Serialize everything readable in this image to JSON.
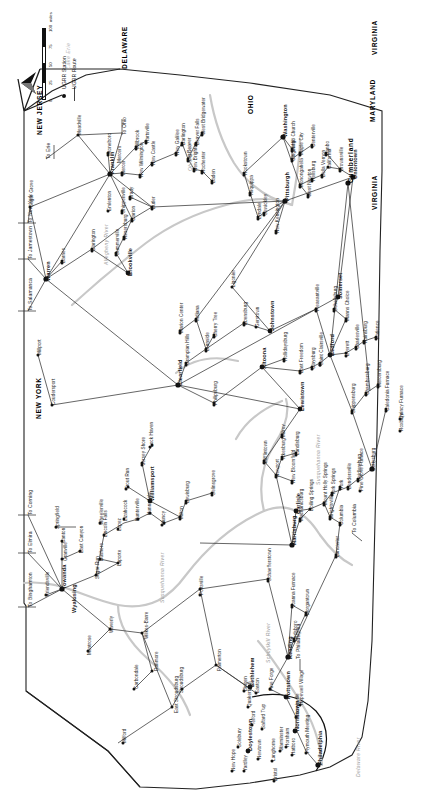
{
  "map": {
    "title": "Underground Railroad in Pennsylvania",
    "orientation": "rotated-90-ccw",
    "legend": {
      "station_label": "UGRR Station",
      "route_label": "UGRR Route",
      "scale_ticks": [
        "0",
        "25",
        "50",
        "75",
        "100"
      ],
      "scale_units": "miles",
      "north_label": "N"
    },
    "states": [
      {
        "name": "NEW JERSEY",
        "x": 676,
        "y": 37
      },
      {
        "name": "DELAWARE",
        "x": 742,
        "y": 122
      },
      {
        "name": "NEW YORK",
        "x": 392,
        "y": 36
      },
      {
        "name": "MARYLAND",
        "x": 689,
        "y": 370
      },
      {
        "name": "VIRGINIA",
        "x": 601,
        "y": 372
      },
      {
        "name": "VIRGINIA",
        "x": 756,
        "y": 372
      },
      {
        "name": "OHIO",
        "x": 697,
        "y": 248
      },
      {
        "name": "Cumberland",
        "x": 628,
        "y": 348
      }
    ],
    "waters": [
      {
        "name": "Lake Erie",
        "x": 742,
        "y": 66
      },
      {
        "name": "Delaware River",
        "x": 34,
        "y": 356
      },
      {
        "name": "Schuylkill River",
        "x": 148,
        "y": 266
      },
      {
        "name": "Susquehanna River",
        "x": 326,
        "y": 316
      },
      {
        "name": "Susquehanna River",
        "x": 208,
        "y": 160
      },
      {
        "name": "Allegheny River",
        "x": 546,
        "y": 104
      },
      {
        "name": "Ohio River",
        "x": 640,
        "y": 188
      }
    ],
    "major_cities": [
      {
        "name": "Philadelphia",
        "x": 46,
        "y": 318
      },
      {
        "name": "Norristown",
        "x": 80,
        "y": 295
      },
      {
        "name": "Doylestown",
        "x": 60,
        "y": 248
      },
      {
        "name": "Bethlehem",
        "x": 124,
        "y": 250
      },
      {
        "name": "Reading",
        "x": 152,
        "y": 288
      },
      {
        "name": "Pottstown",
        "x": 112,
        "y": 286
      },
      {
        "name": "Harrisburg",
        "x": 266,
        "y": 292
      },
      {
        "name": "Carlisle",
        "x": 297,
        "y": 296
      },
      {
        "name": "Williamsport",
        "x": 310,
        "y": 150
      },
      {
        "name": "Clearfield",
        "x": 425,
        "y": 178
      },
      {
        "name": "Altoona",
        "x": 442,
        "y": 262
      },
      {
        "name": "Lewistown",
        "x": 400,
        "y": 300
      },
      {
        "name": "Bedford",
        "x": 455,
        "y": 330
      },
      {
        "name": "Johnstown",
        "x": 480,
        "y": 270
      },
      {
        "name": "Somerset",
        "x": 512,
        "y": 338
      },
      {
        "name": "Pittsburgh",
        "x": 610,
        "y": 285
      },
      {
        "name": "Uniontown",
        "x": 632,
        "y": 353
      },
      {
        "name": "Washington",
        "x": 674,
        "y": 283
      },
      {
        "name": "Franklin",
        "x": 637,
        "y": 110
      },
      {
        "name": "Warren",
        "x": 530,
        "y": 46
      },
      {
        "name": "Brookville",
        "x": 535,
        "y": 128
      },
      {
        "name": "Towanda",
        "x": 222,
        "y": 62
      },
      {
        "name": "Wyalusing",
        "x": 198,
        "y": 72
      }
    ],
    "places": [
      {
        "name": "Milford",
        "x": 68,
        "y": 123
      },
      {
        "name": "East Stroudsburg",
        "x": 98,
        "y": 175
      },
      {
        "name": "Stroudsburg",
        "x": 118,
        "y": 180
      },
      {
        "name": "Palmerton",
        "x": 140,
        "y": 218
      },
      {
        "name": "Easton",
        "x": 118,
        "y": 256
      },
      {
        "name": "Carbondale",
        "x": 122,
        "y": 135
      },
      {
        "name": "Dunmore",
        "x": 140,
        "y": 155
      },
      {
        "name": "Wilkes-Barre",
        "x": 172,
        "y": 145
      },
      {
        "name": "Waverly",
        "x": 178,
        "y": 110
      },
      {
        "name": "Montrose",
        "x": 156,
        "y": 88
      },
      {
        "name": "Friendsville",
        "x": 215,
        "y": 46
      },
      {
        "name": "Sugar Run",
        "x": 232,
        "y": 96
      },
      {
        "name": "Laporte",
        "x": 245,
        "y": 118
      },
      {
        "name": "Dushore",
        "x": 250,
        "y": 100
      },
      {
        "name": "Granville",
        "x": 250,
        "y": 64
      },
      {
        "name": "East Canyon",
        "x": 258,
        "y": 80
      },
      {
        "name": "Springfield",
        "x": 282,
        "y": 56
      },
      {
        "name": "Canton",
        "x": 268,
        "y": 62
      },
      {
        "name": "Wheelerville",
        "x": 286,
        "y": 100
      },
      {
        "name": "Lincoln Falls",
        "x": 274,
        "y": 104
      },
      {
        "name": "Lopez",
        "x": 280,
        "y": 118
      },
      {
        "name": "Lizahcock",
        "x": 290,
        "y": 124
      },
      {
        "name": "Hunterville",
        "x": 290,
        "y": 136
      },
      {
        "name": "Hunnydale",
        "x": 296,
        "y": 148
      },
      {
        "name": "Muncy",
        "x": 286,
        "y": 162
      },
      {
        "name": "Milton",
        "x": 292,
        "y": 180
      },
      {
        "name": "Lewisburg",
        "x": 308,
        "y": 186
      },
      {
        "name": "Selinsgrove",
        "x": 316,
        "y": 212
      },
      {
        "name": "Trout Run",
        "x": 322,
        "y": 126
      },
      {
        "name": "Jersey Shore",
        "x": 346,
        "y": 142
      },
      {
        "name": "Lock Haven",
        "x": 364,
        "y": 150
      },
      {
        "name": "Mifflintown",
        "x": 348,
        "y": 264
      },
      {
        "name": "Newport",
        "x": 334,
        "y": 276
      },
      {
        "name": "New Bloomfield",
        "x": 328,
        "y": 292
      },
      {
        "name": "Ickesburg",
        "x": 352,
        "y": 282
      },
      {
        "name": "Landisburg",
        "x": 356,
        "y": 296
      },
      {
        "name": "Milroy",
        "x": 374,
        "y": 282
      },
      {
        "name": "Philipsburg",
        "x": 406,
        "y": 214
      },
      {
        "name": "Hollidaysburg",
        "x": 450,
        "y": 284
      },
      {
        "name": "Burnside",
        "x": 460,
        "y": 206
      },
      {
        "name": "Cherry Tree",
        "x": 474,
        "y": 214
      },
      {
        "name": "Grampian Hills",
        "x": 446,
        "y": 186
      },
      {
        "name": "Indiana",
        "x": 490,
        "y": 196
      },
      {
        "name": "Marion Center",
        "x": 478,
        "y": 180
      },
      {
        "name": "Ebensburg",
        "x": 486,
        "y": 244
      },
      {
        "name": "Gerstown",
        "x": 484,
        "y": 256
      },
      {
        "name": "Ligonier",
        "x": 524,
        "y": 232
      },
      {
        "name": "East Freedom",
        "x": 438,
        "y": 300
      },
      {
        "name": "Claysburg",
        "x": 442,
        "y": 312
      },
      {
        "name": "Saint Clairsville",
        "x": 446,
        "y": 320
      },
      {
        "name": "Everett",
        "x": 455,
        "y": 346
      },
      {
        "name": "Charlesville",
        "x": 462,
        "y": 356
      },
      {
        "name": "Rainsburg",
        "x": 468,
        "y": 364
      },
      {
        "name": "Patience",
        "x": 472,
        "y": 376
      },
      {
        "name": "Schellsburg",
        "x": 500,
        "y": 334
      },
      {
        "name": "Manns Choice",
        "x": 490,
        "y": 346
      },
      {
        "name": "Pleasantville",
        "x": 500,
        "y": 316
      },
      {
        "name": "Mercersburg",
        "x": 424,
        "y": 378
      },
      {
        "name": "Chambersburg",
        "x": 416,
        "y": 366
      },
      {
        "name": "Shippensburg",
        "x": 398,
        "y": 352
      },
      {
        "name": "Caledonia Furnace",
        "x": 400,
        "y": 386
      },
      {
        "name": "Quincy Furnace",
        "x": 392,
        "y": 400
      },
      {
        "name": "Roxbury",
        "x": 380,
        "y": 400
      },
      {
        "name": "Gettysburg",
        "x": 340,
        "y": 372
      },
      {
        "name": "Heidlersburg",
        "x": 330,
        "y": 358
      },
      {
        "name": "Bendersville",
        "x": 322,
        "y": 348
      },
      {
        "name": "York Springs",
        "x": 316,
        "y": 332
      },
      {
        "name": "Mount Holly Springs",
        "x": 306,
        "y": 324
      },
      {
        "name": "Boiling Springs",
        "x": 300,
        "y": 310
      },
      {
        "name": "Pine Grove Furnace",
        "x": 320,
        "y": 360
      },
      {
        "name": "Mechanicsburg",
        "x": 290,
        "y": 300
      },
      {
        "name": "York",
        "x": 322,
        "y": 340
      },
      {
        "name": "Wrightsville",
        "x": 292,
        "y": 330
      },
      {
        "name": "Columbia",
        "x": 286,
        "y": 340
      },
      {
        "name": "Lancaster",
        "x": 254,
        "y": 336
      },
      {
        "name": "Morgantown",
        "x": 196,
        "y": 306
      },
      {
        "name": "Joanna Furnace",
        "x": 204,
        "y": 292
      },
      {
        "name": "Birdsboro",
        "x": 170,
        "y": 294
      },
      {
        "name": "Schaefferstown",
        "x": 230,
        "y": 268
      },
      {
        "name": "Pottsville",
        "x": 216,
        "y": 200
      },
      {
        "name": "Quakertown",
        "x": 104,
        "y": 248
      },
      {
        "name": "Pine Forge",
        "x": 120,
        "y": 270
      },
      {
        "name": "Phoenixville",
        "x": 92,
        "y": 296
      },
      {
        "name": "Hopewell Village",
        "x": 106,
        "y": 300
      },
      {
        "name": "Bingen",
        "x": 120,
        "y": 244
      },
      {
        "name": "New Hope",
        "x": 40,
        "y": 232
      },
      {
        "name": "Newtown",
        "x": 52,
        "y": 258
      },
      {
        "name": "Langhorne",
        "x": 50,
        "y": 272
      },
      {
        "name": "Yardley",
        "x": 40,
        "y": 244
      },
      {
        "name": "Bristol",
        "x": 30,
        "y": 274
      },
      {
        "name": "Warminster",
        "x": 60,
        "y": 280
      },
      {
        "name": "Hatboro",
        "x": 56,
        "y": 292
      },
      {
        "name": "Horsham",
        "x": 64,
        "y": 286
      },
      {
        "name": "Salfard Twp",
        "x": 82,
        "y": 262
      },
      {
        "name": "Solebury",
        "x": 64,
        "y": 238
      },
      {
        "name": "Telford",
        "x": 86,
        "y": 252
      },
      {
        "name": "Plymouth Meeting",
        "x": 58,
        "y": 306
      },
      {
        "name": "New Kensington",
        "x": 578,
        "y": 276
      },
      {
        "name": "Lyndale",
        "x": 592,
        "y": 258
      },
      {
        "name": "Sewickley",
        "x": 596,
        "y": 264
      },
      {
        "name": "Aliquippa",
        "x": 616,
        "y": 250
      },
      {
        "name": "Hookstown",
        "x": 636,
        "y": 244
      },
      {
        "name": "Monongahela",
        "x": 624,
        "y": 300
      },
      {
        "name": "Hellsburg",
        "x": 630,
        "y": 312
      },
      {
        "name": "West Newton",
        "x": 614,
        "y": 308
      },
      {
        "name": "Bella Vernon",
        "x": 634,
        "y": 322
      },
      {
        "name": "California",
        "x": 642,
        "y": 328
      },
      {
        "name": "Brownsville",
        "x": 640,
        "y": 340
      },
      {
        "name": "Danbo",
        "x": 656,
        "y": 326
      },
      {
        "name": "Mingo Church",
        "x": 660,
        "y": 292
      },
      {
        "name": "Ginger Hill",
        "x": 650,
        "y": 292
      },
      {
        "name": "Maple City",
        "x": 656,
        "y": 300
      },
      {
        "name": "Centerville",
        "x": 664,
        "y": 312
      },
      {
        "name": "Baden",
        "x": 628,
        "y": 212
      },
      {
        "name": "Rochester",
        "x": 638,
        "y": 202
      },
      {
        "name": "New Brighton",
        "x": 640,
        "y": 194
      },
      {
        "name": "Big Beaver",
        "x": 650,
        "y": 188
      },
      {
        "name": "Beaver Falls",
        "x": 666,
        "y": 196
      },
      {
        "name": "West Bridgewater",
        "x": 676,
        "y": 202
      },
      {
        "name": "Darlington",
        "x": 666,
        "y": 182
      },
      {
        "name": "New Galilee",
        "x": 656,
        "y": 176
      },
      {
        "name": "New Castle",
        "x": 646,
        "y": 152
      },
      {
        "name": "New Wilmington",
        "x": 634,
        "y": 140
      },
      {
        "name": "Mercer",
        "x": 636,
        "y": 122
      },
      {
        "name": "Mercers",
        "x": 648,
        "y": 118
      },
      {
        "name": "Stoneboro",
        "x": 656,
        "y": 108
      },
      {
        "name": "Millbrook",
        "x": 662,
        "y": 136
      },
      {
        "name": "Hartsville",
        "x": 668,
        "y": 146
      },
      {
        "name": "Butler",
        "x": 602,
        "y": 152
      },
      {
        "name": "Brady",
        "x": 612,
        "y": 130
      },
      {
        "name": "Meadville",
        "x": 676,
        "y": 78
      },
      {
        "name": "Sugar Grove",
        "x": 604,
        "y": 30
      },
      {
        "name": "Barnes",
        "x": 548,
        "y": 62
      },
      {
        "name": "Clarington",
        "x": 560,
        "y": 92
      },
      {
        "name": "Summerville",
        "x": 556,
        "y": 116
      },
      {
        "name": "Rimersburg",
        "x": 572,
        "y": 124
      },
      {
        "name": "Clarion",
        "x": 590,
        "y": 132
      },
      {
        "name": "Shippenville",
        "x": 598,
        "y": 122
      },
      {
        "name": "Coudersport",
        "x": 406,
        "y": 52
      },
      {
        "name": "Millport",
        "x": 456,
        "y": 38
      },
      {
        "name": "Emlenton",
        "x": 600,
        "y": 108
      }
    ],
    "to_markers": [
      {
        "name": "To Binghamton",
        "x": 204,
        "y": 28
      },
      {
        "name": "To Elmira",
        "x": 258,
        "y": 28
      },
      {
        "name": "To Corning",
        "x": 296,
        "y": 28
      },
      {
        "name": "To Salamanca",
        "x": 500,
        "y": 28
      },
      {
        "name": "To Jamestown",
        "x": 552,
        "y": 28
      },
      {
        "name": "To New York",
        "x": 588,
        "y": 28
      },
      {
        "name": "To Erie",
        "x": 652,
        "y": 46
      },
      {
        "name": "To Ohio",
        "x": 676,
        "y": 122
      },
      {
        "name": "To Philadelphia",
        "x": 152,
        "y": 296
      },
      {
        "name": "To Columbia",
        "x": 278,
        "y": 352
      }
    ]
  }
}
